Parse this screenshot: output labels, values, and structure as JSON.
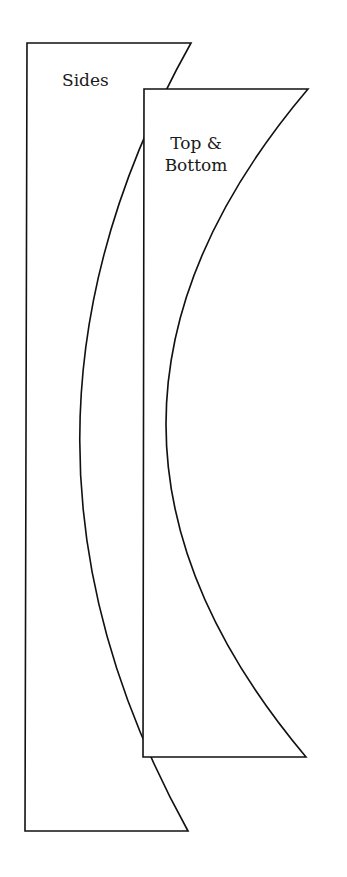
{
  "diagram": {
    "pieces": [
      {
        "id": "sides",
        "label_lines": [
          "Sides"
        ],
        "corners": {
          "top_left": [
            27,
            43
          ],
          "top_right": [
            191,
            43
          ],
          "bottom_right": [
            188,
            831
          ],
          "bottom_left": [
            25,
            831
          ]
        },
        "curve_leftmost": [
          49,
          437
        ]
      },
      {
        "id": "top-bottom",
        "label_lines": [
          "Top &",
          "Bottom"
        ],
        "corners": {
          "top_left": [
            144,
            89
          ],
          "top_right": [
            308,
            89
          ],
          "bottom_right": [
            306,
            757
          ],
          "bottom_left": [
            143,
            757
          ]
        },
        "curve_leftmost": [
          166,
          423
        ]
      }
    ],
    "colors": {
      "stroke": "#111111",
      "fill": "#ffffff",
      "background": "#ffffff"
    }
  }
}
